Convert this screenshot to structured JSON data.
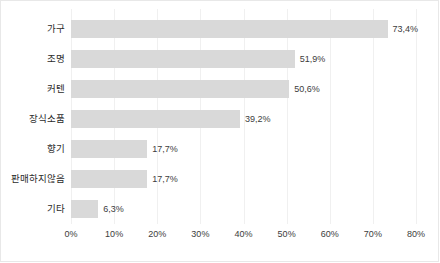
{
  "chart_data": {
    "type": "bar",
    "orientation": "horizontal",
    "title": "",
    "subtitle": "",
    "xlabel": "",
    "ylabel": "",
    "xlim": [
      0,
      80
    ],
    "grid": true,
    "legend": false,
    "bar_color": "#d9d9d9",
    "categories": [
      "가구",
      "조명",
      "커텐",
      "장식소품",
      "향기",
      "판매하지않음",
      "기타"
    ],
    "values": [
      73.4,
      51.9,
      50.6,
      39.2,
      17.7,
      17.7,
      6.3
    ],
    "value_labels": [
      "73,4%",
      "51,9%",
      "50,6%",
      "39,2%",
      "17,7%",
      "17,7%",
      "6,3%"
    ],
    "xticks": [
      0,
      10,
      20,
      30,
      40,
      50,
      60,
      70,
      80
    ],
    "xtick_labels": [
      "0%",
      "10%",
      "20%",
      "30%",
      "40%",
      "50%",
      "60%",
      "70%",
      "80%"
    ]
  }
}
